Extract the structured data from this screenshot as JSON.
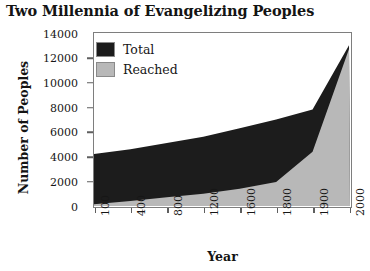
{
  "chart_data": {
    "type": "area",
    "title": "Two Millennia of Evangelizing Peoples",
    "xlabel": "Year",
    "ylabel": "Number of Peoples",
    "categories": [
      "100",
      "400",
      "800",
      "1200",
      "1600",
      "1800",
      "1900",
      "2000"
    ],
    "x_tick_labels": [
      "100",
      "400",
      "800",
      "1200",
      "1600",
      "1800",
      "1900",
      "2000"
    ],
    "y_tick_labels": [
      "0",
      "2000",
      "4000",
      "6000",
      "8000",
      "10000",
      "12000",
      "14000"
    ],
    "y_ticks": [
      0,
      2000,
      4000,
      6000,
      8000,
      10000,
      12000,
      14000
    ],
    "ylim": [
      0,
      14000
    ],
    "grid": false,
    "legend_position": "top-left",
    "stacking": "overlay",
    "series": [
      {
        "name": "Total",
        "color": "#1c1c1c",
        "values": [
          4200,
          4600,
          5100,
          5600,
          6300,
          7000,
          7800,
          13000
        ]
      },
      {
        "name": "Reached",
        "color": "#b8b8b8",
        "values": [
          150,
          400,
          700,
          1000,
          1400,
          1950,
          4400,
          12700
        ]
      }
    ]
  },
  "legend": {
    "items": [
      {
        "label": "Total",
        "color": "#1c1c1c"
      },
      {
        "label": "Reached",
        "color": "#b8b8b8"
      }
    ]
  },
  "colors": {
    "total": "#1c1c1c",
    "reached": "#b8b8b8",
    "frame": "#7e7e7e",
    "background": "#ffffff",
    "text": "#161616"
  }
}
